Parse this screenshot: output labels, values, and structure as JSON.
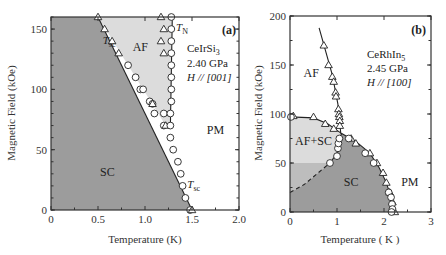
{
  "chart_data": [
    {
      "type": "scatter",
      "panel_label": "(a)",
      "compound": "CeIrSi",
      "compound_sub": "3",
      "pressure": "2.40 GPa",
      "field_dir": "H // [001]",
      "xlabel": "Temperature (K)",
      "ylabel": "Magnetic Field (kOe)",
      "xlim": [
        0,
        2.0
      ],
      "ylim": [
        0,
        160
      ],
      "xticks": [
        "0",
        "0.5",
        "1.0",
        "1.5",
        "2.0"
      ],
      "xtick_values": [
        0,
        0.5,
        1.0,
        1.5,
        2.0
      ],
      "yticks": [
        "0",
        "50",
        "100",
        "150"
      ],
      "ytick_values": [
        0,
        50,
        100,
        150
      ],
      "regions": [
        {
          "label": "SC",
          "T": 0.6,
          "H": 28
        },
        {
          "label": "AF",
          "T": 0.95,
          "H": 132
        },
        {
          "label": "PM",
          "T": 1.75,
          "H": 63
        }
      ],
      "annotations": [
        {
          "text": "T",
          "sub": "sc",
          "T": 0.55,
          "H": 138
        },
        {
          "text": "T",
          "sub": "N",
          "T": 1.33,
          "H": 148
        },
        {
          "text": "T",
          "sub": "sc",
          "T": 1.45,
          "H": 18
        }
      ],
      "series": [
        {
          "name": "Tsc circles",
          "marker": "circle",
          "points": [
            [
              0.82,
              120
            ],
            [
              0.9,
              110
            ],
            [
              0.95,
              100
            ],
            [
              0.98,
              100
            ],
            [
              1.05,
              90
            ],
            [
              1.08,
              88
            ],
            [
              1.1,
              80
            ],
            [
              1.2,
              80
            ],
            [
              1.2,
              70
            ],
            [
              1.27,
              60
            ],
            [
              1.3,
              50
            ],
            [
              1.35,
              40
            ],
            [
              1.38,
              30
            ],
            [
              1.4,
              20
            ],
            [
              1.43,
              10
            ],
            [
              1.48,
              0
            ]
          ]
        },
        {
          "name": "Tsc triangles",
          "marker": "triangle",
          "points": [
            [
              0.5,
              160
            ],
            [
              0.57,
              150
            ],
            [
              0.65,
              140
            ],
            [
              0.72,
              130
            ],
            [
              1.08,
              88
            ],
            [
              1.22,
              70
            ],
            [
              1.5,
              0
            ]
          ]
        },
        {
          "name": "TN circles",
          "marker": "circle",
          "points": [
            [
              1.28,
              160
            ],
            [
              1.28,
              150
            ],
            [
              1.28,
              140
            ],
            [
              1.28,
              130
            ],
            [
              1.28,
              120
            ],
            [
              1.28,
              110
            ],
            [
              1.28,
              100
            ],
            [
              1.28,
              90
            ],
            [
              1.27,
              80
            ],
            [
              1.27,
              70
            ]
          ]
        },
        {
          "name": "TN triangles",
          "marker": "triangle",
          "points": [
            [
              1.17,
              160
            ],
            [
              1.2,
              150
            ],
            [
              1.17,
              140
            ],
            [
              1.2,
              130
            ]
          ]
        }
      ],
      "lines": [
        {
          "name": "Tsc line",
          "points": [
            [
              0.5,
              160
            ],
            [
              1.5,
              0
            ]
          ]
        },
        {
          "name": "TN line",
          "points": [
            [
              1.29,
              160
            ],
            [
              1.27,
              70
            ]
          ]
        }
      ],
      "shaded": [
        {
          "name": "SC region",
          "color": "#9c9c9c"
        },
        {
          "name": "AF region",
          "color": "#dcdcdc"
        }
      ]
    },
    {
      "type": "scatter",
      "panel_label": "(b)",
      "compound": "CeRhIn",
      "compound_sub": "5",
      "pressure": "2.45 GPa",
      "field_dir": "H // [100]",
      "xlabel": "Temperature ( K )",
      "ylabel": "Magnetic Field (kOe)",
      "xlim": [
        0,
        3
      ],
      "ylim": [
        0,
        200
      ],
      "xticks": [
        "0",
        "1",
        "2",
        "3"
      ],
      "xtick_values": [
        0,
        1,
        2,
        3
      ],
      "yticks": [
        "0",
        "50",
        "100",
        "150",
        "200"
      ],
      "ytick_values": [
        0,
        50,
        100,
        150,
        200
      ],
      "regions": [
        {
          "label": "AF",
          "T": 0.45,
          "H": 138
        },
        {
          "label": "AF+SC",
          "T": 0.5,
          "H": 68
        },
        {
          "label": "SC",
          "T": 1.3,
          "H": 27
        },
        {
          "label": "PM",
          "T": 2.55,
          "H": 27
        }
      ],
      "series": [
        {
          "name": "AF boundary triangles",
          "marker": "triangle",
          "points": [
            [
              0.72,
              170
            ],
            [
              0.82,
              150
            ],
            [
              0.9,
              138
            ],
            [
              0.93,
              133
            ],
            [
              0.97,
              122
            ],
            [
              0.98,
              118
            ],
            [
              1.03,
              105
            ],
            [
              1.04,
              100
            ],
            [
              1.05,
              97
            ],
            [
              1.06,
              93
            ],
            [
              1.06,
              88
            ],
            [
              0.07,
              98
            ],
            [
              0.5,
              97
            ],
            [
              0.75,
              90
            ],
            [
              0.93,
              85
            ],
            [
              1.3,
              75
            ],
            [
              1.4,
              70
            ],
            [
              1.7,
              60
            ],
            [
              1.85,
              50
            ],
            [
              1.98,
              40
            ],
            [
              2.05,
              30
            ],
            [
              2.12,
              20
            ],
            [
              2.18,
              10
            ],
            [
              2.23,
              0
            ]
          ]
        },
        {
          "name": "SC circles",
          "marker": "circle",
          "points": [
            [
              0.02,
              97
            ],
            [
              0.85,
              50
            ],
            [
              1.0,
              57
            ],
            [
              1.02,
              65
            ],
            [
              1.03,
              70
            ],
            [
              1.05,
              75
            ],
            [
              1.25,
              75
            ],
            [
              1.6,
              60
            ],
            [
              1.78,
              50
            ],
            [
              2.1,
              20
            ],
            [
              2.15,
              15
            ],
            [
              2.17,
              8
            ],
            [
              2.18,
              3
            ],
            [
              2.16,
              0
            ]
          ]
        }
      ],
      "lines": [
        {
          "name": "AF TN line",
          "points": [
            [
              0.62,
              188
            ],
            [
              0.9,
              140
            ],
            [
              1.02,
              110
            ],
            [
              1.08,
              80
            ]
          ]
        },
        {
          "name": "AF upper boundary",
          "points": [
            [
              0,
              97
            ],
            [
              0.5,
              96
            ],
            [
              0.8,
              90
            ],
            [
              1.1,
              80
            ],
            [
              1.4,
              72
            ],
            [
              1.7,
              60
            ],
            [
              1.9,
              45
            ],
            [
              2.05,
              30
            ],
            [
              2.15,
              15
            ],
            [
              2.2,
              0
            ]
          ]
        },
        {
          "name": "SC left boundary",
          "points": [
            [
              0.85,
              50
            ],
            [
              1.0,
              60
            ],
            [
              1.05,
              75
            ],
            [
              1.1,
              80
            ]
          ]
        },
        {
          "name": "dashed extrapolation",
          "dashed": true,
          "points": [
            [
              0,
              20
            ],
            [
              0.3,
              28
            ],
            [
              0.6,
              40
            ],
            [
              0.85,
              50
            ]
          ]
        }
      ],
      "shaded": [
        {
          "name": "AF+SC region",
          "color": "#dcdcdc"
        },
        {
          "name": "SC region",
          "color": "#9c9c9c"
        },
        {
          "name": "AF+SC lower region",
          "color": "#bdbdbd"
        }
      ]
    }
  ]
}
